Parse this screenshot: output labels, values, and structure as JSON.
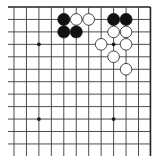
{
  "board": {
    "description": "Go board diagram, top-right corner region of a 19x19 board",
    "origin_x": 14,
    "origin_y": 7,
    "spacing": 12.45,
    "columns": 12,
    "rows": 12,
    "top_edge": true,
    "right_edge": true,
    "line_color": "#3a3a3a",
    "star_points": [
      {
        "col": 2,
        "row": 3
      },
      {
        "col": 8,
        "row": 3
      },
      {
        "col": 2,
        "row": 9
      },
      {
        "col": 8,
        "row": 9
      }
    ]
  },
  "stones": [
    {
      "color": "black",
      "col": 4,
      "row": 1
    },
    {
      "color": "white",
      "col": 5,
      "row": 1
    },
    {
      "color": "white",
      "col": 6,
      "row": 1
    },
    {
      "color": "black",
      "col": 4,
      "row": 2
    },
    {
      "color": "black",
      "col": 5,
      "row": 2
    },
    {
      "color": "black",
      "col": 8,
      "row": 1
    },
    {
      "color": "black",
      "col": 9,
      "row": 1
    },
    {
      "color": "white",
      "col": 8,
      "row": 2
    },
    {
      "color": "white",
      "col": 9,
      "row": 2
    },
    {
      "color": "white",
      "col": 7,
      "row": 3
    },
    {
      "color": "white",
      "col": 9,
      "row": 3
    },
    {
      "color": "white",
      "col": 8,
      "row": 4
    },
    {
      "color": "white",
      "col": 9,
      "row": 5
    }
  ]
}
